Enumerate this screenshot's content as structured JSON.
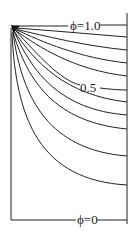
{
  "diagram": {
    "type": "equipotential-field",
    "labels": {
      "top": "ϕ=1.0",
      "middle": "0.5",
      "bottom": "ϕ=0"
    },
    "source": "filled corner source at top-left",
    "curve_count": 10,
    "colors": {
      "stroke": "#222222",
      "background": "#ffffff"
    }
  }
}
